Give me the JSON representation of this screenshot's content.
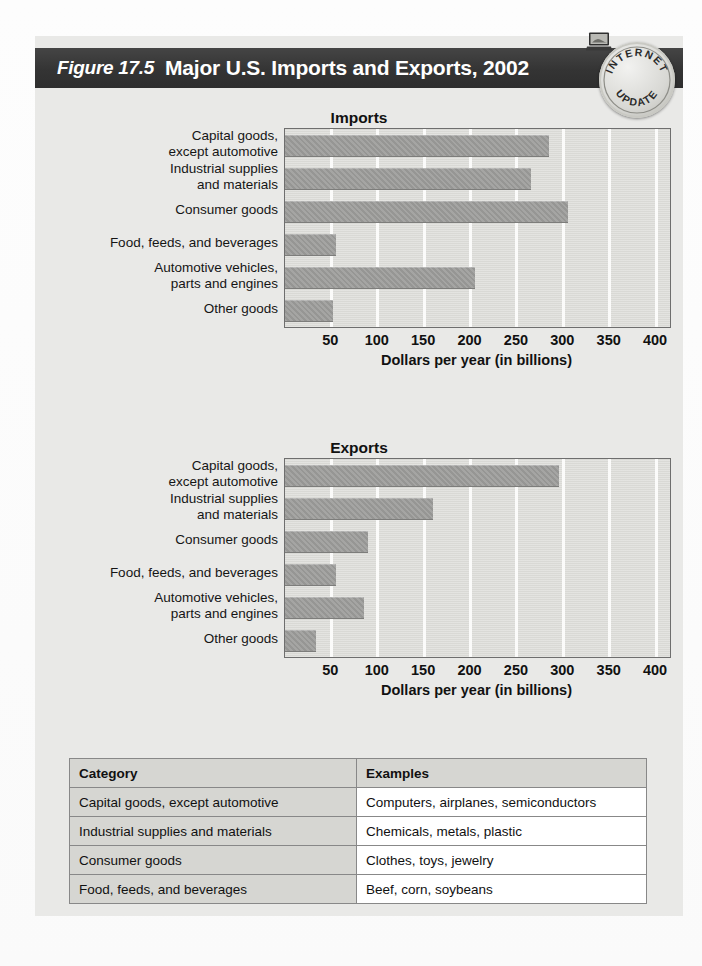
{
  "figure": {
    "number": "Figure 17.5",
    "title": "Major U.S. Imports and Exports, 2002",
    "seal": {
      "top_text": "INTERNET",
      "bottom_text": "UPDATE",
      "icon": "laptop-icon"
    }
  },
  "axis": {
    "label": "Dollars per year (in billions)",
    "ticks": [
      "50",
      "100",
      "150",
      "200",
      "250",
      "300",
      "350",
      "400"
    ]
  },
  "categories": [
    "Capital goods,\nexcept automotive",
    "Industrial supplies\nand materials",
    "Consumer goods",
    "Food, feeds, and beverages",
    "Automotive vehicles,\nparts and engines",
    "Other goods"
  ],
  "charts": [
    {
      "title": "Imports"
    },
    {
      "title": "Exports"
    }
  ],
  "table": {
    "headers": [
      "Category",
      "Examples"
    ],
    "rows": [
      [
        "Capital goods, except automotive",
        "Computers, airplanes, semiconductors"
      ],
      [
        "Industrial supplies and materials",
        "Chemicals, metals, plastic"
      ],
      [
        "Consumer goods",
        "Clothes, toys, jewelry"
      ],
      [
        "Food, feeds, and beverages",
        "Beef, corn, soybeans"
      ]
    ]
  },
  "colors": {
    "header_bar": "#343434",
    "bar_fill": "#9e9e9c",
    "plot_bg": "#dcdcd8",
    "figure_bg": "#e9e9e7"
  },
  "chart_data": [
    {
      "type": "bar",
      "orientation": "horizontal",
      "title": "Imports",
      "xlabel": "Dollars per year (in billions)",
      "ylabel": "",
      "xlim": [
        0,
        415
      ],
      "xticks": [
        50,
        100,
        150,
        200,
        250,
        300,
        350,
        400
      ],
      "grid": true,
      "legend": "none",
      "categories": [
        "Capital goods, except automotive",
        "Industrial supplies and materials",
        "Consumer goods",
        "Food, feeds, and beverages",
        "Automotive vehicles, parts and engines",
        "Other goods"
      ],
      "values": [
        285,
        265,
        305,
        55,
        205,
        52
      ]
    },
    {
      "type": "bar",
      "orientation": "horizontal",
      "title": "Exports",
      "xlabel": "Dollars per year (in billions)",
      "ylabel": "",
      "xlim": [
        0,
        415
      ],
      "xticks": [
        50,
        100,
        150,
        200,
        250,
        300,
        350,
        400
      ],
      "grid": true,
      "legend": "none",
      "categories": [
        "Capital goods, except automotive",
        "Industrial supplies and materials",
        "Consumer goods",
        "Food, feeds, and beverages",
        "Automotive vehicles, parts and engines",
        "Other goods"
      ],
      "values": [
        295,
        160,
        90,
        55,
        85,
        33
      ]
    }
  ]
}
